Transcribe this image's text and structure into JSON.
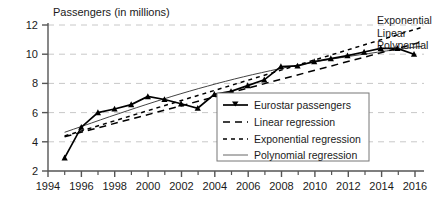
{
  "chart_data": {
    "type": "line",
    "title": "Passengers (in millions)",
    "xlabel": "",
    "ylabel": "Passengers (in millions)",
    "xlim": [
      1994,
      2016.6
    ],
    "ylim": [
      2,
      12
    ],
    "grid": true,
    "yticks": [
      2,
      4,
      6,
      8,
      10,
      12
    ],
    "ytick_labels": [
      "2",
      "4",
      "6",
      "8",
      "10",
      "12"
    ],
    "xticks": [
      1994,
      1996,
      1998,
      2000,
      2002,
      2004,
      2006,
      2008,
      2010,
      2012,
      2014,
      2016
    ],
    "xtick_labels": [
      "1994",
      "1996",
      "1998",
      "2000",
      "2002",
      "2004",
      "2006",
      "2008",
      "2010",
      "2012",
      "2014",
      "2016"
    ],
    "minor_xticks": [
      1995,
      1997,
      1999,
      2001,
      2003,
      2005,
      2007,
      2009,
      2011,
      2013,
      2015
    ],
    "legend_position": "center-right-inside",
    "x": [
      1995,
      1996,
      1997,
      1998,
      1999,
      2000,
      2001,
      2002,
      2003,
      2004,
      2005,
      2006,
      2007,
      2008,
      2009,
      2010,
      2011,
      2012,
      2013,
      2014,
      2015,
      2016
    ],
    "series": [
      {
        "name": "Eurostar passengers",
        "style": "solid-with-triangle-markers",
        "values": [
          2.9,
          5.0,
          6.0,
          6.25,
          6.55,
          7.1,
          6.9,
          6.6,
          6.3,
          7.25,
          7.45,
          7.85,
          8.25,
          9.15,
          9.2,
          9.5,
          9.7,
          9.9,
          10.15,
          10.4,
          10.4,
          10.0
        ]
      },
      {
        "name": "Linear regression",
        "style": "long-dashed",
        "x_endpoints": [
          1995,
          2016.5
        ],
        "y_endpoints": [
          4.35,
          10.85
        ]
      },
      {
        "name": "Exponential regression",
        "style": "short-dashed",
        "x_endpoints": [
          1995,
          2016.5
        ],
        "y_endpoints": [
          4.4,
          11.85
        ]
      },
      {
        "name": "Polynomial regression",
        "style": "thin-solid",
        "x_endpoints": [
          1995,
          2016.5
        ],
        "y_endpoints": [
          4.65,
          10.55
        ]
      }
    ],
    "annotations": [
      {
        "text": "Exponential",
        "x": 2016.7,
        "y": 11.85
      },
      {
        "text": "Linear",
        "x": 2016.7,
        "y": 10.95
      },
      {
        "text": "Polynomial",
        "x": 2016.7,
        "y": 10.25
      }
    ],
    "legend_entries": [
      {
        "label": "Eurostar passengers",
        "style": "solid-with-triangle-markers"
      },
      {
        "label": "Linear regression",
        "style": "long-dashed"
      },
      {
        "label": "Exponential regression",
        "style": "short-dashed"
      },
      {
        "label": "Polynomial regression",
        "style": "thin-solid"
      }
    ],
    "colors": {
      "data_line": "#000000",
      "grid": "#c8c8c8",
      "axis": "#555555",
      "text": "#1a1a1a",
      "legend_border": "#777777",
      "background": "#ffffff"
    }
  }
}
